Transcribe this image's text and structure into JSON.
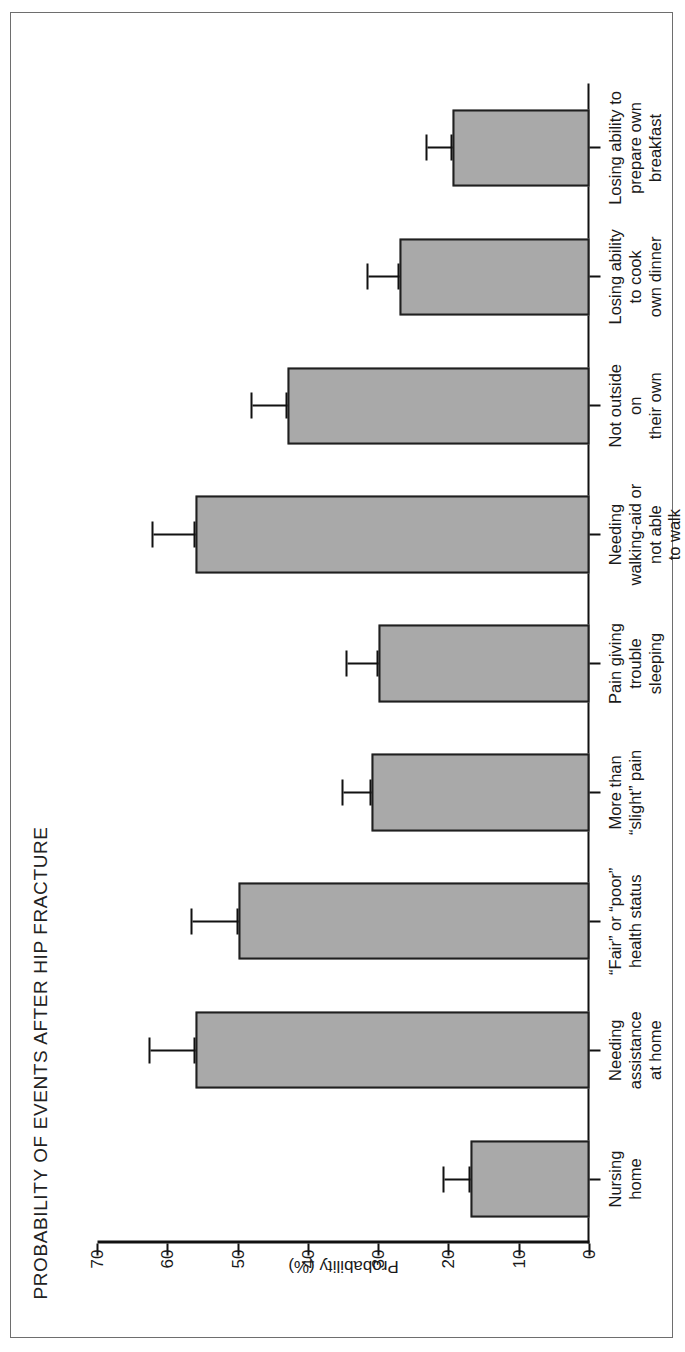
{
  "figure": {
    "title": "PROBABILITY OF EVENTS AFTER HIP FRACTURE",
    "frame_color": "#6e6e6e",
    "bar_fill_color": "#a9a9a9",
    "bar_border_color": "#1f1f1f",
    "axis_color": "#111111"
  },
  "chart_data": {
    "type": "bar",
    "title": "PROBABILITY OF EVENTS AFTER HIP FRACTURE",
    "xlabel": "",
    "ylabel": "Probability (%)",
    "ylim": [
      0,
      70
    ],
    "yticks": [
      0,
      10,
      20,
      30,
      40,
      50,
      60,
      70
    ],
    "ytick_labels": [
      "0",
      "10",
      "20",
      "30",
      "40",
      "50",
      "60",
      "70"
    ],
    "grid": false,
    "legend": false,
    "orientation": "vertical-bars-rotated-page",
    "error_bars": "95% confidence interval (upper cap shown)",
    "categories": [
      "Nursing\nhome",
      "Needing\nassistance\nat home",
      "“Fair” or “poor”\nhealth status",
      "More than\n“slight” pain",
      "Pain giving\ntrouble\nsleeping",
      "Needing\nwalking-aid or\nnot able\nto walk",
      "Not outside\non\ntheir own",
      "Losing ability\nto cook\nown dinner",
      "Losing ability to\nprepare own\nbreakfast"
    ],
    "values": [
      17,
      56,
      50,
      31,
      30,
      56,
      43,
      27,
      19.5
    ],
    "error_upper": [
      20.7,
      62.5,
      56.5,
      35,
      34.5,
      62,
      48,
      31.5,
      23
    ],
    "series": [
      {
        "name": "Probability (%)",
        "values": [
          17,
          56,
          50,
          31,
          30,
          56,
          43,
          27,
          19.5
        ]
      }
    ]
  }
}
